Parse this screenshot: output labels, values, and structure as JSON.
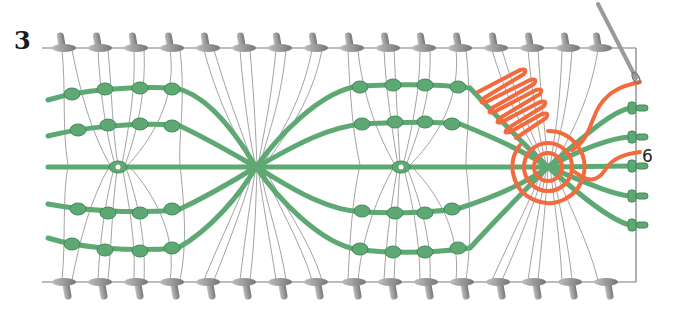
{
  "figure": {
    "step_number": "3",
    "thread_label": "6",
    "colors": {
      "cord_green": "#5ea874",
      "cord_green_dark": "#3f8a57",
      "warp_gray": "#8c8c8c",
      "pin_gray": "#a9a9a9",
      "working_thread_orange": "#f26a3d",
      "frame_line": "#7a7a7a"
    },
    "icons": {
      "needle": "needle-icon",
      "pin": "pin-icon",
      "knot": "knot-icon"
    }
  }
}
